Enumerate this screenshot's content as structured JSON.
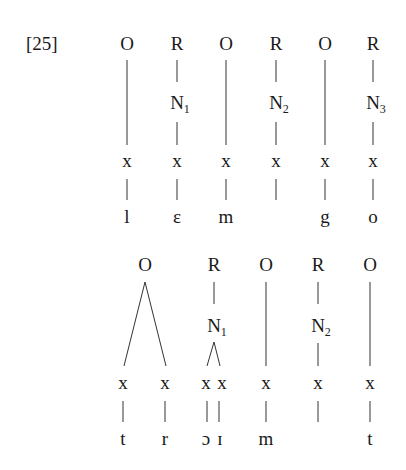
{
  "example_number": "[25]",
  "tree1": {
    "word": "lemgo",
    "nodes": [
      {
        "type": "O",
        "nucleus": null,
        "skeleton": [
          "x"
        ],
        "segments": [
          "l"
        ]
      },
      {
        "type": "R",
        "nucleus": "N",
        "nucleus_index": "1",
        "skeleton": [
          "x"
        ],
        "segments": [
          "ε"
        ]
      },
      {
        "type": "O",
        "nucleus": null,
        "skeleton": [
          "x"
        ],
        "segments": [
          "m"
        ]
      },
      {
        "type": "R",
        "nucleus": "N",
        "nucleus_index": "2",
        "skeleton": [
          "x"
        ],
        "segments": [
          ""
        ]
      },
      {
        "type": "O",
        "nucleus": null,
        "skeleton": [
          "x"
        ],
        "segments": [
          "g"
        ]
      },
      {
        "type": "R",
        "nucleus": "N",
        "nucleus_index": "3",
        "skeleton": [
          "x"
        ],
        "segments": [
          "o"
        ]
      }
    ]
  },
  "tree2": {
    "word": "troimt",
    "nodes": [
      {
        "type": "O",
        "nucleus": null,
        "skeleton": [
          "x",
          "x"
        ],
        "segments": [
          "t",
          "r"
        ],
        "branching": true
      },
      {
        "type": "R",
        "nucleus": "N",
        "nucleus_index": "1",
        "skeleton": [
          "x",
          "x"
        ],
        "segments": [
          "ɔ",
          "ɪ"
        ],
        "branching": true
      },
      {
        "type": "O",
        "nucleus": null,
        "skeleton": [
          "x"
        ],
        "segments": [
          "m"
        ]
      },
      {
        "type": "R",
        "nucleus": "N",
        "nucleus_index": "2",
        "skeleton": [
          "x"
        ],
        "segments": [
          ""
        ]
      },
      {
        "type": "O",
        "nucleus": null,
        "skeleton": [
          "x"
        ],
        "segments": [
          "t"
        ]
      }
    ]
  }
}
